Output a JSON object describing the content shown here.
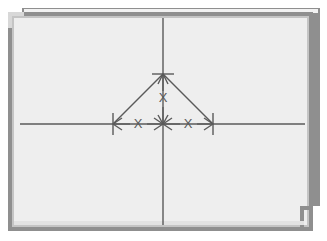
{
  "figure": {
    "background_color": "#f0f0f0",
    "page_color": "#ffffff",
    "frame_outer_color": "#8c8c8c",
    "frame_inner_color": "#b8b8b8",
    "frame_highlight_color": "#f7f7f7",
    "line_color": "#5a5a5a",
    "axis_color": "#5a5a5a"
  },
  "axes": {
    "horizontal": {
      "y": 124,
      "x_start": 20,
      "x_end": 307,
      "label": "horizontal-centerline"
    },
    "vertical": {
      "x": 163,
      "y_start": 18,
      "y_end": 226,
      "label": "vertical-centerline"
    },
    "origin": {
      "x": 163,
      "y": 124
    }
  },
  "shape": {
    "name": "chevron",
    "apex": {
      "x": 163,
      "y": 74
    },
    "left_foot": {
      "x": 113,
      "y": 124
    },
    "right_foot": {
      "x": 213,
      "y": 124
    }
  },
  "dimensions": [
    {
      "name": "vertical-dimension",
      "label": "X",
      "label_x": 163,
      "label_y": 99,
      "orientation": "vertical",
      "from": {
        "x": 163,
        "y": 74
      },
      "to": {
        "x": 163,
        "y": 124
      }
    },
    {
      "name": "left-horizontal-dimension",
      "label": "X",
      "label_x": 138,
      "label_y": 124,
      "orientation": "horizontal",
      "from": {
        "x": 113,
        "y": 124
      },
      "to": {
        "x": 163,
        "y": 124
      }
    },
    {
      "name": "right-horizontal-dimension",
      "label": "X",
      "label_x": 188,
      "label_y": 124,
      "orientation": "horizontal",
      "from": {
        "x": 163,
        "y": 124
      },
      "to": {
        "x": 213,
        "y": 124
      }
    }
  ],
  "extension_ticks": [
    {
      "name": "left-extension-tick",
      "x": 113,
      "y_top": 114,
      "y_bottom": 134
    },
    {
      "name": "right-extension-tick",
      "x": 213,
      "y_top": 114,
      "y_bottom": 134
    },
    {
      "name": "apex-extension-tick",
      "x_left": 153,
      "x_right": 173,
      "y": 74
    }
  ]
}
